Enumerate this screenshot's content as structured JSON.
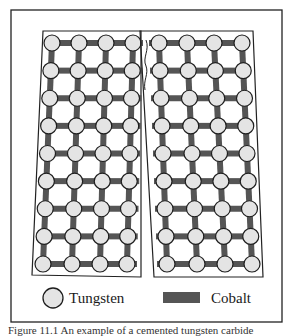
{
  "figure": {
    "type": "schematic",
    "colors": {
      "frame": "#222222",
      "cobalt": "#555555",
      "tungsten_fill": "#e4e4e4",
      "tungsten_stroke": "#1e1e1e"
    },
    "grid": {
      "rows": 9,
      "columns_per_half": 4,
      "left_half": {
        "top_row_x": [
          52,
          79,
          106,
          133
        ],
        "bottom_row_x": [
          43,
          72,
          100,
          127
        ],
        "outline": [
          [
            43,
            31
          ],
          [
            141,
            31
          ],
          [
            141,
            277
          ],
          [
            32,
            275
          ]
        ]
      },
      "right_half": {
        "top_row_x": [
          159,
          187,
          214,
          242
        ],
        "bottom_row_x": [
          167,
          197,
          225,
          252
        ],
        "outline": [
          [
            140,
            31
          ],
          [
            253,
            31
          ],
          [
            263,
            277
          ],
          [
            154,
            277
          ]
        ]
      },
      "top_y": 43,
      "bottom_y": 264,
      "node_radius": 8
    },
    "crack": {
      "label": "crack"
    }
  },
  "legend": {
    "tungsten_label": "Tungsten",
    "cobalt_label": "Cobalt"
  },
  "caption": {
    "text": "Figure 11.1   An example of a cemented tungsten carbide"
  }
}
